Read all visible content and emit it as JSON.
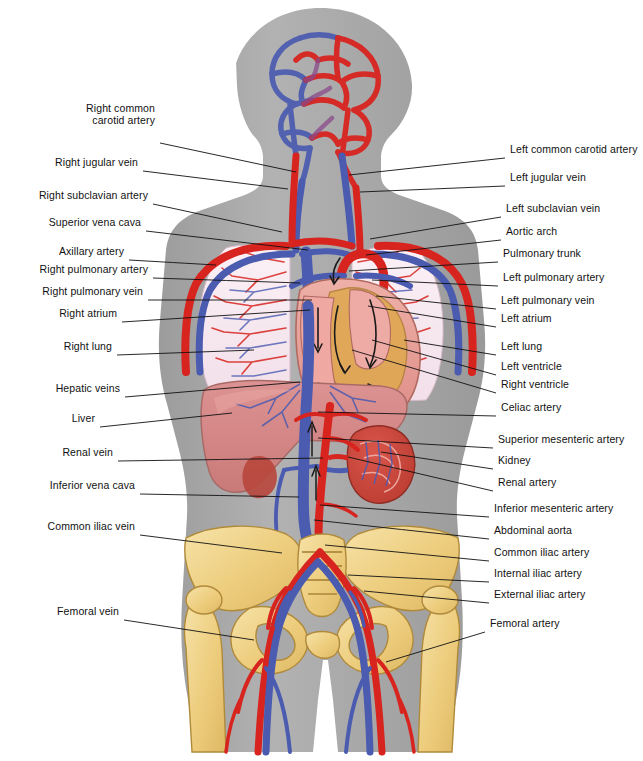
{
  "diagram": {
    "background_color": "#ffffff",
    "body_silhouette_color": "#a9a9a9",
    "artery_color": "#d8241f",
    "vein_color": "#3f53a8",
    "bone_color": "#f0d18a",
    "liver_color": "#d98a8a",
    "heart_color": "#e8a39d",
    "heart_muscle_color": "#e0a854",
    "lung_color": "#f6e4ee",
    "kidney_color": "#cf4a3e",
    "leader_line_color": "#111111"
  },
  "labels_left": [
    {
      "id": "right-common-carotid-artery",
      "lines": [
        "Right common",
        "carotid artery"
      ],
      "text_x": 155,
      "text_y": 124,
      "anchor_x": 160,
      "anchor_y": 143,
      "target_x": 296,
      "target_y": 172
    },
    {
      "id": "right-jugular-vein",
      "lines": [
        "Right jugular vein"
      ],
      "text_x": 138,
      "text_y": 166,
      "anchor_x": 143,
      "anchor_y": 171,
      "target_x": 288,
      "target_y": 189
    },
    {
      "id": "right-subclavian-artery",
      "lines": [
        "Right subclavian artery"
      ],
      "text_x": 148,
      "text_y": 199,
      "anchor_x": 153,
      "anchor_y": 204,
      "target_x": 282,
      "target_y": 232
    },
    {
      "id": "superior-vena-cava",
      "lines": [
        "Superior vena cava"
      ],
      "text_x": 141,
      "text_y": 226,
      "anchor_x": 146,
      "anchor_y": 231,
      "target_x": 308,
      "target_y": 250
    },
    {
      "id": "axillary-artery",
      "lines": [
        "Axillary artery"
      ],
      "text_x": 124,
      "text_y": 255,
      "anchor_x": 129,
      "anchor_y": 260,
      "target_x": 216,
      "target_y": 265
    },
    {
      "id": "right-pulmonary-artery",
      "lines": [
        "Right pulmonary artery"
      ],
      "text_x": 148,
      "text_y": 273,
      "anchor_x": 153,
      "anchor_y": 278,
      "target_x": 300,
      "target_y": 283
    },
    {
      "id": "right-pulmonary-vein",
      "lines": [
        "Right pulmonary vein"
      ],
      "text_x": 143,
      "text_y": 295,
      "anchor_x": 148,
      "anchor_y": 300,
      "target_x": 312,
      "target_y": 300
    },
    {
      "id": "right-atrium",
      "lines": [
        "Right atrium"
      ],
      "text_x": 117,
      "text_y": 317,
      "anchor_x": 122,
      "anchor_y": 322,
      "target_x": 310,
      "target_y": 310
    },
    {
      "id": "right-lung",
      "lines": [
        "Right lung"
      ],
      "text_x": 112,
      "text_y": 350,
      "anchor_x": 117,
      "anchor_y": 355,
      "target_x": 254,
      "target_y": 350
    },
    {
      "id": "hepatic-veins",
      "lines": [
        "Hepatic veins"
      ],
      "text_x": 120,
      "text_y": 392,
      "anchor_x": 125,
      "anchor_y": 397,
      "target_x": 300,
      "target_y": 382
    },
    {
      "id": "liver",
      "lines": [
        "Liver"
      ],
      "text_x": 95,
      "text_y": 422,
      "anchor_x": 100,
      "anchor_y": 427,
      "target_x": 232,
      "target_y": 413
    },
    {
      "id": "renal-vein",
      "lines": [
        "Renal vein"
      ],
      "text_x": 113,
      "text_y": 456,
      "anchor_x": 118,
      "anchor_y": 461,
      "target_x": 323,
      "target_y": 458
    },
    {
      "id": "inferior-vena-cava",
      "lines": [
        "Inferior vena cava"
      ],
      "text_x": 135,
      "text_y": 489,
      "anchor_x": 140,
      "anchor_y": 494,
      "target_x": 299,
      "target_y": 497
    },
    {
      "id": "common-iliac-vein",
      "lines": [
        "Common iliac vein"
      ],
      "text_x": 135,
      "text_y": 530,
      "anchor_x": 140,
      "anchor_y": 535,
      "target_x": 282,
      "target_y": 553
    },
    {
      "id": "femoral-vein",
      "lines": [
        "Femoral vein"
      ],
      "text_x": 119,
      "text_y": 615,
      "anchor_x": 124,
      "anchor_y": 620,
      "target_x": 254,
      "target_y": 640
    }
  ],
  "labels_right": [
    {
      "id": "left-common-carotid-artery",
      "lines": [
        "Left common carotid artery"
      ],
      "text_x": 510,
      "text_y": 153,
      "anchor_x": 505,
      "anchor_y": 158,
      "target_x": 349,
      "target_y": 175
    },
    {
      "id": "left-jugular-vein",
      "lines": [
        "Left jugular vein"
      ],
      "text_x": 510,
      "text_y": 181,
      "anchor_x": 505,
      "anchor_y": 186,
      "target_x": 360,
      "target_y": 192
    },
    {
      "id": "left-subclavian-vein",
      "lines": [
        "Left subclavian vein"
      ],
      "text_x": 506,
      "text_y": 212,
      "anchor_x": 501,
      "anchor_y": 217,
      "target_x": 370,
      "target_y": 239
    },
    {
      "id": "aortic-arch",
      "lines": [
        "Aortic arch"
      ],
      "text_x": 506,
      "text_y": 235,
      "anchor_x": 501,
      "anchor_y": 240,
      "target_x": 366,
      "target_y": 255
    },
    {
      "id": "pulmonary-trunk",
      "lines": [
        "Pulmonary trunk"
      ],
      "text_x": 503,
      "text_y": 257,
      "anchor_x": 498,
      "anchor_y": 262,
      "target_x": 349,
      "target_y": 271
    },
    {
      "id": "left-pulmonary-artery",
      "lines": [
        "Left pulmonary artery"
      ],
      "text_x": 503,
      "text_y": 281,
      "anchor_x": 498,
      "anchor_y": 286,
      "target_x": 372,
      "target_y": 280
    },
    {
      "id": "left-pulmonary-vein",
      "lines": [
        "Left pulmonary vein"
      ],
      "text_x": 501,
      "text_y": 304,
      "anchor_x": 496,
      "anchor_y": 309,
      "target_x": 376,
      "target_y": 296
    },
    {
      "id": "left-atrium",
      "lines": [
        "Left atrium"
      ],
      "text_x": 501,
      "text_y": 322,
      "anchor_x": 496,
      "anchor_y": 327,
      "target_x": 368,
      "target_y": 306
    },
    {
      "id": "left-lung",
      "lines": [
        "Left lung"
      ],
      "text_x": 501,
      "text_y": 350,
      "anchor_x": 496,
      "anchor_y": 355,
      "target_x": 404,
      "target_y": 340
    },
    {
      "id": "left-ventricle",
      "lines": [
        "Left ventricle"
      ],
      "text_x": 501,
      "text_y": 370,
      "anchor_x": 496,
      "anchor_y": 375,
      "target_x": 372,
      "target_y": 340
    },
    {
      "id": "right-ventricle",
      "lines": [
        "Right ventricle"
      ],
      "text_x": 501,
      "text_y": 388,
      "anchor_x": 496,
      "anchor_y": 393,
      "target_x": 352,
      "target_y": 350
    },
    {
      "id": "celiac-artery",
      "lines": [
        "Celiac artery"
      ],
      "text_x": 501,
      "text_y": 411,
      "anchor_x": 496,
      "anchor_y": 416,
      "target_x": 318,
      "target_y": 412
    },
    {
      "id": "superior-mesenteric-artery",
      "lines": [
        "Superior mesenteric artery"
      ],
      "text_x": 498,
      "text_y": 443,
      "anchor_x": 493,
      "anchor_y": 448,
      "target_x": 318,
      "target_y": 438
    },
    {
      "id": "kidney",
      "lines": [
        "Kidney"
      ],
      "text_x": 498,
      "text_y": 464,
      "anchor_x": 493,
      "anchor_y": 469,
      "target_x": 381,
      "target_y": 452
    },
    {
      "id": "renal-artery",
      "lines": [
        "Renal artery"
      ],
      "text_x": 498,
      "text_y": 486,
      "anchor_x": 493,
      "anchor_y": 491,
      "target_x": 348,
      "target_y": 457
    },
    {
      "id": "inferior-mesenteric-artery",
      "lines": [
        "Inferior mesenteric artery"
      ],
      "text_x": 494,
      "text_y": 512,
      "anchor_x": 489,
      "anchor_y": 517,
      "target_x": 320,
      "target_y": 505
    },
    {
      "id": "abdominal-aorta",
      "lines": [
        "Abdominal aorta"
      ],
      "text_x": 494,
      "text_y": 534,
      "anchor_x": 489,
      "anchor_y": 539,
      "target_x": 314,
      "target_y": 520
    },
    {
      "id": "common-iliac-artery",
      "lines": [
        "Common iliac artery"
      ],
      "text_x": 494,
      "text_y": 556,
      "anchor_x": 489,
      "anchor_y": 561,
      "target_x": 325,
      "target_y": 545
    },
    {
      "id": "internal-iliac-artery",
      "lines": [
        "Internal iliac artery"
      ],
      "text_x": 494,
      "text_y": 577,
      "anchor_x": 489,
      "anchor_y": 582,
      "target_x": 348,
      "target_y": 575
    },
    {
      "id": "external-iliac-artery",
      "lines": [
        "External iliac artery"
      ],
      "text_x": 494,
      "text_y": 598,
      "anchor_x": 489,
      "anchor_y": 603,
      "target_x": 364,
      "target_y": 591
    },
    {
      "id": "femoral-artery",
      "lines": [
        "Femoral artery"
      ],
      "text_x": 490,
      "text_y": 627,
      "anchor_x": 485,
      "anchor_y": 632,
      "target_x": 386,
      "target_y": 662
    }
  ],
  "organs": [
    {
      "id": "brain-vascular-network",
      "name": "Cerebral vascular network"
    },
    {
      "id": "right-lung",
      "name": "Right lung"
    },
    {
      "id": "left-lung",
      "name": "Left lung"
    },
    {
      "id": "heart",
      "name": "Heart"
    },
    {
      "id": "liver",
      "name": "Liver"
    },
    {
      "id": "kidney",
      "name": "Kidney"
    },
    {
      "id": "pelvis-bone",
      "name": "Pelvic bones"
    },
    {
      "id": "sacrum",
      "name": "Sacrum"
    },
    {
      "id": "femur",
      "name": "Femur"
    }
  ]
}
